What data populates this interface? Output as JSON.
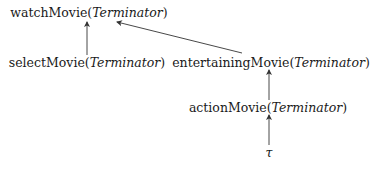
{
  "diagram": {
    "nodes": [
      {
        "id": "watchMovie",
        "predicate": "watchMovie(",
        "argument": "Terminator",
        "close": ")"
      },
      {
        "id": "selectMovie",
        "predicate": "selectMovie(",
        "argument": "Terminator",
        "close": ")"
      },
      {
        "id": "entertainingMovie",
        "predicate": "entertainingMovie(",
        "argument": "Terminator",
        "close": ")"
      },
      {
        "id": "actionMovie",
        "predicate": "actionMovie(",
        "argument": "Terminator",
        "close": ")"
      },
      {
        "id": "tau",
        "symbol": "τ"
      }
    ],
    "edges": [
      {
        "from": "selectMovie",
        "to": "watchMovie"
      },
      {
        "from": "entertainingMovie",
        "to": "watchMovie"
      },
      {
        "from": "actionMovie",
        "to": "entertainingMovie"
      },
      {
        "from": "tau",
        "to": "actionMovie"
      }
    ],
    "colors": {
      "text": "#1a1a1a",
      "edge": "#333333",
      "background": "#ffffff"
    }
  }
}
